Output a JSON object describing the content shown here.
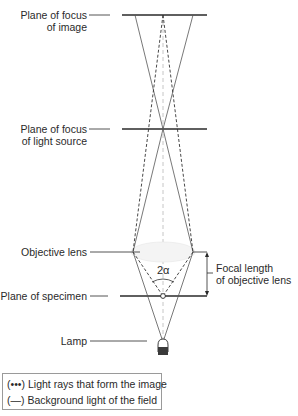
{
  "labels": {
    "image_plane": [
      "Plane of focus",
      "of image"
    ],
    "source_plane": [
      "Plane of focus",
      "of light source"
    ],
    "objective": "Objective lens",
    "specimen": "Plane of specimen",
    "lamp": "Lamp",
    "focal": [
      "Focal length",
      "of objective lens"
    ],
    "angle": "2α"
  },
  "legend": {
    "items": [
      {
        "symbol": "(•••)",
        "text": "Light rays that form the image"
      },
      {
        "symbol": "(—)",
        "text": "Background light of the field"
      }
    ]
  },
  "colors": {
    "line": "#2a2a2a",
    "ray": "#555555",
    "axis": "#b0b0b0"
  }
}
